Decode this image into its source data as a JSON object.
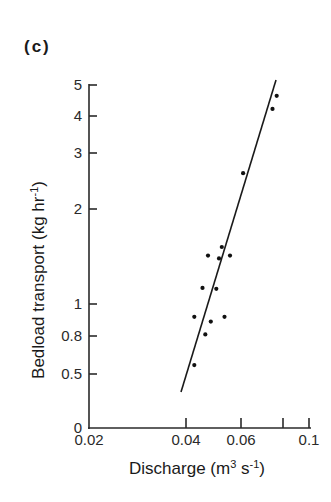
{
  "panel_label": "(c)",
  "chart_data": {
    "type": "scatter",
    "title": "(c)",
    "xlabel": "Discharge (m3 s-1)",
    "ylabel": "Bedload transport (kg hr-1)",
    "xlabel_parts": {
      "main": "Discharge (m",
      "sup1": "3",
      "mid": " s",
      "sup2": "-1",
      "end": ")"
    },
    "ylabel_parts": {
      "main": "Bedload transport (kg hr",
      "sup": "-1",
      "end": ")"
    },
    "x_ticks": [
      {
        "value": 0.02,
        "label": "0.02",
        "px": 89
      },
      {
        "value": 0.04,
        "label": "0.04",
        "px": 186
      },
      {
        "value": 0.06,
        "label": "0.06",
        "px": 241
      },
      {
        "value": 0.08,
        "label": "",
        "px": 283
      },
      {
        "value": 0.1,
        "label": "0.1",
        "px": 309
      }
    ],
    "y_ticks": [
      {
        "value": 0,
        "label": "0",
        "px": 428
      },
      {
        "value": 0.5,
        "label": "0.5",
        "px": 374
      },
      {
        "value": 0.8,
        "label": "0.8",
        "px": 336
      },
      {
        "value": 1,
        "label": "1",
        "px": 304
      },
      {
        "value": 2,
        "label": "2",
        "px": 209
      },
      {
        "value": 3,
        "label": "3",
        "px": 153
      },
      {
        "value": 4,
        "label": "4",
        "px": 116
      },
      {
        "value": 5,
        "label": "5",
        "px": 85
      }
    ],
    "xlim": [
      0.02,
      0.1
    ],
    "ylim": [
      0,
      5
    ],
    "x_scale": "log",
    "y_scale": "log",
    "grid": false,
    "legend": null,
    "series": [
      {
        "name": "observations",
        "points": [
          {
            "x": 0.077,
            "y": 4.65
          },
          {
            "x": 0.075,
            "y": 4.23
          },
          {
            "x": 0.061,
            "y": 2.64
          },
          {
            "x": 0.053,
            "y": 1.6
          },
          {
            "x": 0.048,
            "y": 1.51
          },
          {
            "x": 0.052,
            "y": 1.48
          },
          {
            "x": 0.056,
            "y": 1.51
          },
          {
            "x": 0.046,
            "y": 1.17
          },
          {
            "x": 0.051,
            "y": 1.16
          },
          {
            "x": 0.043,
            "y": 0.92
          },
          {
            "x": 0.049,
            "y": 0.89
          },
          {
            "x": 0.054,
            "y": 0.92
          },
          {
            "x": 0.047,
            "y": 0.81
          },
          {
            "x": 0.043,
            "y": 0.57
          }
        ]
      },
      {
        "name": "regression line",
        "type": "line",
        "points": [
          {
            "x": 0.039,
            "y": 0.38
          },
          {
            "x": 0.078,
            "y": 5.1
          }
        ]
      }
    ]
  }
}
